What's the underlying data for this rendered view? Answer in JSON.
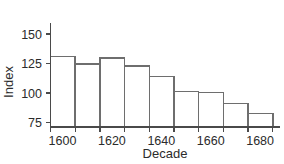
{
  "chart_data": {
    "type": "bar",
    "title": "",
    "xlabel": "Decade",
    "ylabel": "Index",
    "categories": [
      "1600",
      "1610",
      "1620",
      "1630",
      "1640",
      "1650",
      "1660",
      "1670",
      "1680"
    ],
    "values": [
      131,
      124.5,
      129.5,
      123,
      114,
      101.5,
      100.5,
      91,
      82.5
    ],
    "ylim": [
      75,
      158
    ],
    "xlim": [
      1600,
      1690
    ],
    "yticks": [
      75,
      100,
      125,
      150
    ],
    "ytick_labels": [
      "75",
      "100",
      "125",
      "150"
    ],
    "xticks": [
      1600,
      1610,
      1620,
      1630,
      1640,
      1650,
      1660,
      1670,
      1680,
      1690
    ],
    "xtick_labels_shown": [
      "1600",
      "1620",
      "1640",
      "1660",
      "1680"
    ],
    "xtick_labeled_values": [
      1600,
      1620,
      1640,
      1660,
      1680
    ],
    "grid": false,
    "legend": null,
    "bar_fill": "#ffffff",
    "bar_stroke": "#6e6e6e",
    "axis_color": "#4a4a4a",
    "text_color": "#2b2b2b"
  }
}
